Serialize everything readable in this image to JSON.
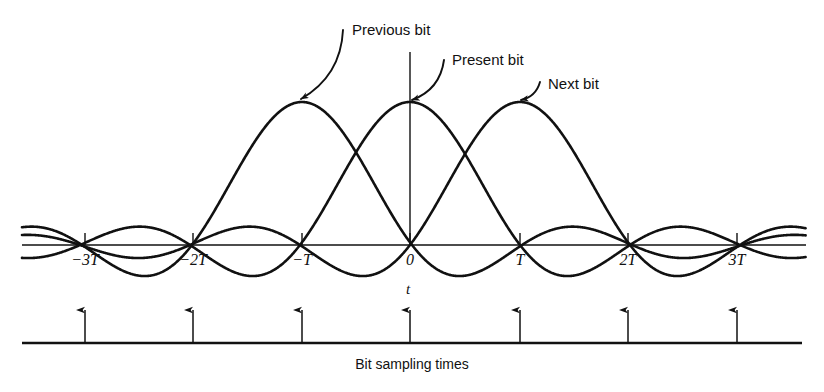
{
  "figure": {
    "width": 824,
    "height": 392,
    "background": "#ffffff",
    "ink": "#111111"
  },
  "callouts": [
    {
      "id": "previous-bit",
      "label": "Previous bit",
      "text_x": 352,
      "text_y": 22,
      "arrow_tail_x": 343,
      "arrow_tail_y": 30,
      "arrow_head_x": 301,
      "arrow_head_y": 99
    },
    {
      "id": "present-bit",
      "label": "Present bit",
      "text_x": 452,
      "text_y": 52,
      "arrow_tail_x": 444,
      "arrow_tail_y": 60,
      "arrow_head_x": 412,
      "arrow_head_y": 100
    },
    {
      "id": "next-bit",
      "label": "Next bit",
      "text_x": 548,
      "text_y": 76,
      "arrow_tail_x": 540,
      "arrow_tail_y": 82,
      "arrow_head_x": 521,
      "arrow_head_y": 100
    }
  ],
  "axis": {
    "y": 245,
    "x_start": 22,
    "x_end": 806,
    "vertical_line": {
      "x": 410,
      "y_top": 52,
      "y_bottom": 245
    },
    "variable_label": "t",
    "variable_label_x": 406,
    "variable_label_y": 287,
    "tick_height": 12
  },
  "ticks": [
    {
      "label": "−3T",
      "x": 85
    },
    {
      "label": "−2T",
      "x": 193
    },
    {
      "label": "−T",
      "x": 302
    },
    {
      "label": "0",
      "x": 410
    },
    {
      "label": "T",
      "x": 520
    },
    {
      "label": "2T",
      "x": 628
    },
    {
      "label": "3T",
      "x": 737
    }
  ],
  "tick_label_y": 252,
  "pulses": [
    {
      "id": "previous-bit-pulse",
      "center_index": 2,
      "center_x": 302,
      "peak_y": 102
    },
    {
      "id": "present-bit-pulse",
      "center_index": 3,
      "center_x": 410,
      "peak_y": 102
    },
    {
      "id": "next-bit-pulse",
      "center_index": 4,
      "center_x": 520,
      "peak_y": 102
    }
  ],
  "sampling": {
    "baseline_y": 343,
    "baseline_x_start": 22,
    "baseline_x_end": 802,
    "arrow_top_y": 310,
    "arrow_x_positions": [
      85,
      193,
      302,
      410,
      520,
      628,
      737
    ],
    "caption": "Bit sampling times",
    "caption_x": 412,
    "caption_y": 357
  }
}
